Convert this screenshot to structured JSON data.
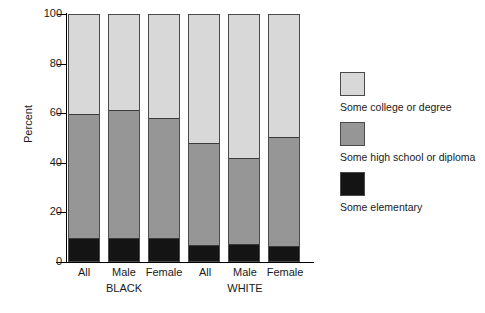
{
  "chart_data": {
    "type": "bar",
    "subtype": "stacked-bar-percent",
    "title": "",
    "xlabel": "",
    "ylabel": "Percent",
    "ylim": [
      0,
      100
    ],
    "yticks": [
      0,
      20,
      40,
      60,
      80,
      100
    ],
    "ytick_labels": [
      "0",
      "20",
      "40",
      "60",
      "80",
      "100"
    ],
    "grid": false,
    "legend_position": "right",
    "categories": [
      "All",
      "Male",
      "Female",
      "All",
      "Male",
      "Female"
    ],
    "group_labels": [
      "BLACK",
      "WHITE"
    ],
    "groups": [
      {
        "name": "BLACK",
        "categories": [
          "All",
          "Male",
          "Female"
        ]
      },
      {
        "name": "WHITE",
        "categories": [
          "All",
          "Male",
          "Female"
        ]
      }
    ],
    "series": [
      {
        "name": "Some elementary",
        "color": "#141414",
        "values": [
          9.5,
          9.8,
          9.5,
          7.0,
          7.2,
          6.5
        ]
      },
      {
        "name": "Some high school or diploma",
        "color": "#969696",
        "values": [
          50.0,
          51.5,
          48.5,
          41.0,
          34.8,
          44.0
        ]
      },
      {
        "name": "Some college or degree",
        "color": "#d8d8d8",
        "values": [
          40.5,
          38.7,
          42.0,
          52.0,
          58.0,
          49.5
        ]
      }
    ],
    "cumulative_tops": {
      "Some elementary": [
        9.5,
        9.8,
        9.5,
        7.0,
        7.2,
        6.5
      ],
      "Some high school or diploma": [
        59.5,
        61.3,
        58.0,
        48.0,
        42.0,
        50.5
      ],
      "Some college or degree": [
        100,
        100,
        100,
        100,
        100,
        100
      ]
    }
  },
  "axis": {
    "y_title": "Percent",
    "ticks": [
      "100",
      "80",
      "60",
      "40",
      "20",
      "0"
    ]
  },
  "x_labels": [
    {
      "label": "All"
    },
    {
      "label": "Male"
    },
    {
      "label": "Female"
    },
    {
      "label": "All"
    },
    {
      "label": "Male"
    },
    {
      "label": "Female"
    }
  ],
  "group_labels": [
    {
      "label": "BLACK"
    },
    {
      "label": "WHITE"
    }
  ],
  "legend": {
    "items": [
      {
        "label": "Some college or degree",
        "color": "#d8d8d8"
      },
      {
        "label": "Some high school or diploma",
        "color": "#969696"
      },
      {
        "label": "Some elementary",
        "color": "#141414"
      }
    ]
  }
}
